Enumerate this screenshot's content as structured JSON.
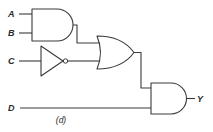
{
  "diagram": {
    "type": "logic-circuit",
    "caption": "(d)",
    "inputs": [
      {
        "id": "A",
        "label": "A"
      },
      {
        "id": "B",
        "label": "B"
      },
      {
        "id": "C",
        "label": "C"
      },
      {
        "id": "D",
        "label": "D"
      }
    ],
    "output": {
      "id": "Y",
      "label": "Y"
    },
    "gates": [
      {
        "id": "and1",
        "type": "AND",
        "inputs": [
          "A",
          "B"
        ]
      },
      {
        "id": "not1",
        "type": "NOT",
        "inputs": [
          "C"
        ]
      },
      {
        "id": "or1",
        "type": "OR",
        "inputs": [
          "and1",
          "not1"
        ]
      },
      {
        "id": "and2",
        "type": "AND",
        "inputs": [
          "or1",
          "D"
        ],
        "output": "Y"
      }
    ],
    "expression": "Y = (A·B + C')·D",
    "colors": {
      "stroke": "#3a3a3a",
      "background": "#ffffff"
    }
  }
}
